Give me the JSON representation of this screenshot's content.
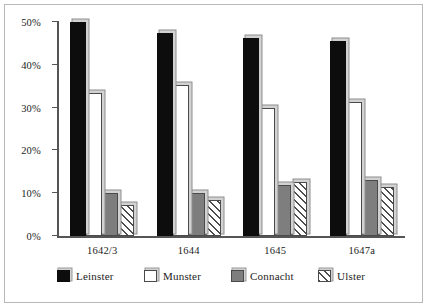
{
  "chart_data": {
    "type": "bar",
    "title": "",
    "subtitle": "",
    "xlabel": "",
    "ylabel": "",
    "categories": [
      "1642/3",
      "1644",
      "1645",
      "1647a"
    ],
    "ylim": [
      0,
      50
    ],
    "ytick_values": [
      0,
      10,
      20,
      30,
      40,
      50
    ],
    "ytick_labels": [
      "0%",
      "10%",
      "20%",
      "30%",
      "40%",
      "50%"
    ],
    "grid": false,
    "legend_position": "bottom",
    "series": [
      {
        "name": "Leinster",
        "color": "#0d0d0d",
        "pattern": "solid",
        "values": [
          50.0,
          47.5,
          46.3,
          45.5
        ]
      },
      {
        "name": "Munster",
        "color": "#ffffff",
        "pattern": "empty",
        "values": [
          33.3,
          35.2,
          30.0,
          31.3
        ]
      },
      {
        "name": "Connacht",
        "color": "#7e7e7e",
        "pattern": "solid",
        "values": [
          10.0,
          10.0,
          12.0,
          13.2
        ]
      },
      {
        "name": "Ulster",
        "color": "#ffffff",
        "pattern": "hatch",
        "values": [
          7.2,
          8.3,
          12.7,
          11.5
        ]
      }
    ]
  },
  "legend": {
    "items": [
      {
        "label": "Leinster"
      },
      {
        "label": "Munster"
      },
      {
        "label": "Connacht"
      },
      {
        "label": "Ulster"
      }
    ]
  }
}
